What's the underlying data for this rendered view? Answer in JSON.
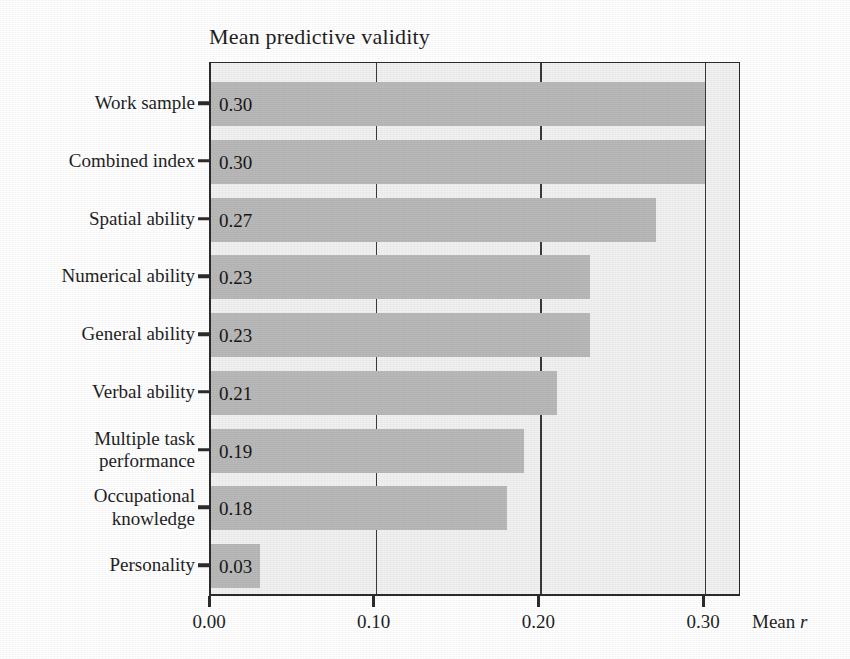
{
  "chart_data": {
    "type": "bar",
    "orientation": "horizontal",
    "title": "Mean predictive validity",
    "xlabel": "Mean r",
    "ylabel": "",
    "xlim": [
      0.0,
      0.3225
    ],
    "xticks": [
      "0.00",
      "0.10",
      "0.20",
      "0.30"
    ],
    "xtick_values": [
      0.0,
      0.1,
      0.2,
      0.3
    ],
    "grid": "vertical gridlines at 0.10, 0.20, 0.30",
    "legend": "none",
    "categories": [
      "Work sample",
      "Combined index",
      "Spatial ability",
      "Numerical ability",
      "General ability",
      "Verbal ability",
      "Multiple task\nperformance",
      "Occupational\nknowledge",
      "Personality"
    ],
    "values": [
      0.3,
      0.3,
      0.27,
      0.23,
      0.23,
      0.21,
      0.19,
      0.18,
      0.03
    ],
    "value_labels": [
      "0.30",
      "0.30",
      "0.27",
      "0.23",
      "0.23",
      "0.21",
      "0.19",
      "0.18",
      "0.03"
    ]
  },
  "style": {
    "bar_color": "#b9b9b9",
    "plot_background": "#f1f1f1",
    "axis_color": "#2b2b2b",
    "gridline_color": "#3a3a3a",
    "text_color": "#1f1f1f",
    "page_background": "#ffffff"
  }
}
